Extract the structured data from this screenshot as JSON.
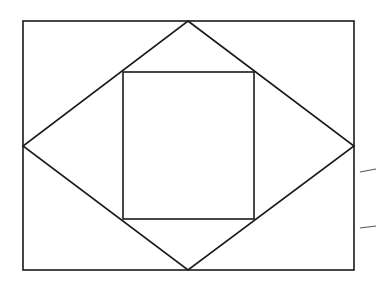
{
  "diagram": {
    "type": "geometric-figure",
    "stroke_color": "#1a1a1a",
    "background": "#ffffff",
    "outer_rectangle": {
      "x1": 23,
      "y1": 21,
      "x2": 354,
      "y2": 270
    },
    "rhombus": {
      "top": [
        188,
        21
      ],
      "right": [
        354,
        146
      ],
      "bottom": [
        188,
        270
      ],
      "left": [
        23,
        146
      ]
    },
    "inner_rectangle": {
      "x1": 123,
      "y1": 72,
      "x2": 254,
      "y2": 219
    },
    "edge_marks": [
      {
        "x1": 360,
        "y1": 172,
        "x2": 376,
        "y2": 169
      },
      {
        "x1": 360,
        "y1": 228,
        "x2": 376,
        "y2": 226
      }
    ]
  }
}
